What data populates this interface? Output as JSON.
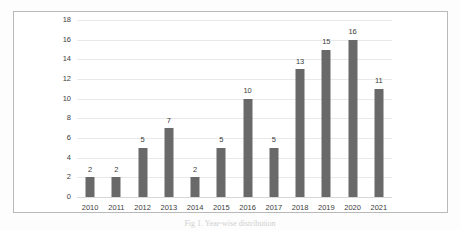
{
  "chart_data": {
    "type": "bar",
    "title": "",
    "subtitle": "",
    "xlabel": "",
    "ylabel": "",
    "categories": [
      "2010",
      "2011",
      "2012",
      "2013",
      "2014",
      "2015",
      "2016",
      "2017",
      "2018",
      "2019",
      "2020",
      "2021"
    ],
    "values": [
      2,
      2,
      5,
      7,
      2,
      5,
      10,
      5,
      13,
      15,
      16,
      11
    ],
    "data_labels": [
      "2",
      "2",
      "5",
      "7",
      "2",
      "5",
      "10",
      "5",
      "13",
      "15",
      "16",
      "11"
    ],
    "ylim": [
      0,
      18
    ],
    "ytick_labels": [
      "0",
      "2",
      "4",
      "6",
      "8",
      "10",
      "12",
      "14",
      "16",
      "18"
    ],
    "ytick_values": [
      0,
      2,
      4,
      6,
      8,
      10,
      12,
      14,
      16,
      18
    ],
    "grid": true,
    "grid_axis": "y",
    "legend": false,
    "legend_position": "none",
    "bar_color": "#696969",
    "grid_color": "#e9e9e9",
    "text_color": "#3c3c3c",
    "frame_color": "#b9b9b9",
    "background": "#ffffff",
    "annotations": []
  },
  "caption": {
    "text": "Fig 1. Year-wise distribution"
  }
}
